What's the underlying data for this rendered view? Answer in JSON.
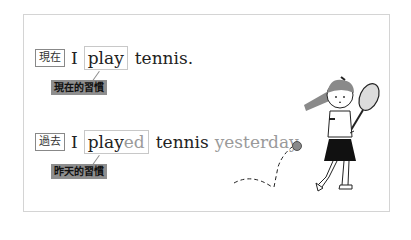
{
  "card": {
    "rows": [
      {
        "tense_tag": "現在",
        "subject": "I",
        "verb_base": "play",
        "verb_suffix": "",
        "object": "tennis.",
        "time_phrase": "",
        "note": "現在的習慣"
      },
      {
        "tense_tag": "過去",
        "subject": "I",
        "verb_base": "play",
        "verb_suffix": "ed",
        "object": "tennis",
        "time_phrase": "yesterday.",
        "note": "昨天的習慣"
      }
    ]
  },
  "illustration": {
    "subject": "girl-playing-tennis",
    "colors": {
      "hair": "#8a8a8a",
      "skirt": "#111111",
      "ball": "#8a8a8a",
      "line": "#222222"
    }
  }
}
